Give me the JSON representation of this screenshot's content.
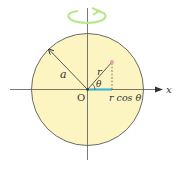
{
  "diagram": {
    "colors": {
      "disk_fill": "#fcf5c2",
      "disk_stroke": "#5a5a5a",
      "axis": "#555555",
      "rotation_arrow": "#b6e88a",
      "projection": "#3fb6d8",
      "point": "#f2a0a8"
    },
    "labels": {
      "radius": "a",
      "r": "r",
      "theta": "θ",
      "origin": "O",
      "projection": "r cos θ",
      "x_axis": "x"
    },
    "icons": {
      "rotation": "rotation-arrow-icon"
    }
  }
}
